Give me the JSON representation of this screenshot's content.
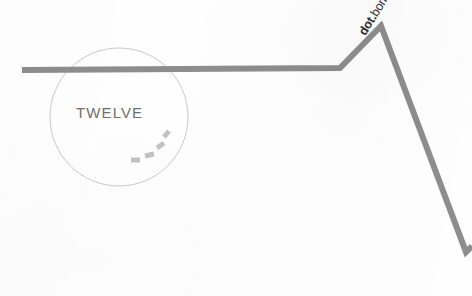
{
  "canvas": {
    "width": 472,
    "height": 296,
    "background_color": "#fefefe"
  },
  "palette": {
    "line_gray": "#8d8d8d",
    "circle_outline": "#c9c9c9",
    "dash_gray": "#c2c2c2",
    "twelve_text": "#6f6f6f",
    "brand_text": "#2b2b2b"
  },
  "circle": {
    "name": "twelve-circle",
    "center_x": 119,
    "center_y": 117,
    "radius": 69,
    "stroke_width": 1,
    "fill": "none"
  },
  "labels": {
    "twelve": "TWELVE",
    "brand_bold": "dot.",
    "brand_regular": "bomb",
    "brand_rotation_deg": -58
  },
  "polyline": {
    "name": "dotbomb-trend-line",
    "stroke_width": 6,
    "points": [
      {
        "x": 22,
        "y": 70
      },
      {
        "x": 340,
        "y": 68
      },
      {
        "x": 381,
        "y": 26
      },
      {
        "x": 466,
        "y": 252
      },
      {
        "x": 472,
        "y": 246
      }
    ]
  },
  "dashed_arc": {
    "name": "swoosh-dashes",
    "segments": [
      {
        "x1": 131,
        "y1": 160,
        "x2": 140,
        "y2": 160,
        "width": 5
      },
      {
        "x1": 145,
        "y1": 156,
        "x2": 154,
        "y2": 154,
        "width": 5
      },
      {
        "x1": 157,
        "y1": 148,
        "x2": 164,
        "y2": 143,
        "width": 5
      },
      {
        "x1": 164,
        "y1": 137,
        "x2": 169,
        "y2": 131,
        "width": 5
      }
    ]
  }
}
